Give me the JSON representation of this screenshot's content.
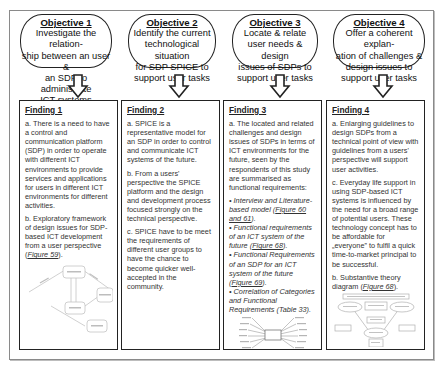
{
  "objectives": [
    {
      "title": "Objective 1",
      "lines": [
        "Investigate the relation-",
        "ship between an user &",
        "an SDP to administrate",
        "ICT systems"
      ]
    },
    {
      "title": "Objective 2",
      "lines": [
        "Identify the current",
        "technological situation",
        "for SDP SPICE to",
        "support user tasks"
      ]
    },
    {
      "title": "Objective 3",
      "lines": [
        "Locate & relate",
        "user needs & design",
        "issues of SDPs to",
        "support user tasks"
      ]
    },
    {
      "title": "Objective 4",
      "lines": [
        "Offer a coherent explan-",
        "ation of challenges &",
        "design issues to",
        "support user tasks"
      ]
    }
  ],
  "findings": [
    {
      "title": "Finding 1",
      "a": "a. There is a need to have a control and communication platform (SDP) in order to operate with different ICT environments to provide services and applications for users in different ICT environments for different activities.",
      "b_text": "b. Exploratory framework of design issues for SDP-based ICT development from a user perspective (",
      "b_link": "Figure 59",
      "b_end": ").",
      "thumbnail": "framework-diagram-thumbnail"
    },
    {
      "title": "Finding 2",
      "a": "a. SPICE is a representative model  for an SDP in order to control and communicate ICT systems of the future.",
      "b": "b. From a users' perspective the SPICE platform and the design and development process focused strongly on the technical perspective.",
      "c": "c. SPICE have to be meet the requirements of different user groups to have the chance to become quicker well-accepted  in the community."
    },
    {
      "title": "Finding 3",
      "a": "a. The located and related challenges and design issues of SDPs in terms of ICT environments for the future, seen by the respondents of this study are summarised as functional requirements:",
      "bullets": [
        {
          "text": "• Interview and Literature-based model (",
          "link": "Figure 60 and 61",
          "end": ")."
        },
        {
          "text": "• Functional  requirements of an ICT system of the future (",
          "link": "Figure 68",
          "end": ")."
        },
        {
          "text": "• Functional Requirements of an SDP for an ICT system of the future (",
          "link": "Figure 69",
          "end": ")."
        },
        {
          "text": "• Correlation of Categories and Functional Requirements (Table 33).",
          "link": "",
          "end": ""
        }
      ],
      "thumbnail": "mindmap-thumbnail"
    },
    {
      "title": "Finding 4",
      "a": "a. Enlarging guidelines to design SDPs from a technical point of view with guidelines from a users' perspective will support user activities.",
      "c": "c. Everyday life support in using SDP-based ICT systems is influenced by the need for a broad range of potential users. These technology concept has to be affordable for „everyone” to fulfil a quick time-to-market principal to be successful.",
      "b_text": "b. Substantive theory diagram (",
      "b_link": "Figure 68",
      "b_end": ").",
      "thumbnail": "theory-diagram-thumbnail"
    }
  ]
}
